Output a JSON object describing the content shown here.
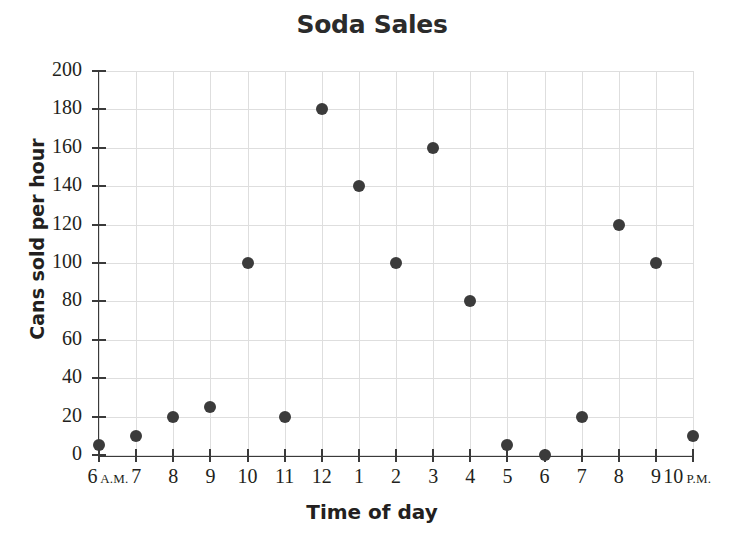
{
  "chart_data": {
    "type": "scatter",
    "title": "Soda Sales",
    "xlabel": "Time of day",
    "ylabel": "Cans sold per hour",
    "grid": true,
    "legend": "none",
    "xlim": [
      0,
      16
    ],
    "ylim": [
      0,
      200
    ],
    "ytick_step": 20,
    "categories": [
      "6 A.M.",
      "7",
      "8",
      "9",
      "10",
      "11",
      "12",
      "1",
      "2",
      "3",
      "4",
      "5",
      "6",
      "7",
      "8",
      "9",
      "10 P.M."
    ],
    "xtick_labels": [
      {
        "number": "6",
        "ampm": "A.M."
      },
      {
        "number": "7",
        "ampm": ""
      },
      {
        "number": "8",
        "ampm": ""
      },
      {
        "number": "9",
        "ampm": ""
      },
      {
        "number": "10",
        "ampm": ""
      },
      {
        "number": "11",
        "ampm": ""
      },
      {
        "number": "12",
        "ampm": ""
      },
      {
        "number": "1",
        "ampm": ""
      },
      {
        "number": "2",
        "ampm": ""
      },
      {
        "number": "3",
        "ampm": ""
      },
      {
        "number": "4",
        "ampm": ""
      },
      {
        "number": "5",
        "ampm": ""
      },
      {
        "number": "6",
        "ampm": ""
      },
      {
        "number": "7",
        "ampm": ""
      },
      {
        "number": "8",
        "ampm": ""
      },
      {
        "number": "9",
        "ampm": ""
      },
      {
        "number": "10",
        "ampm": "P.M."
      }
    ],
    "ytick_labels": [
      "0",
      "20",
      "40",
      "60",
      "80",
      "100",
      "120",
      "140",
      "160",
      "180",
      "200"
    ],
    "values": [
      5,
      10,
      20,
      25,
      100,
      20,
      180,
      140,
      100,
      160,
      80,
      5,
      0,
      20,
      120,
      100,
      10
    ],
    "marker_color": "#3b3b3b",
    "gridline_color": "#dedede",
    "axis_color": "#3a3a3a",
    "background_color": "#ffffff"
  }
}
